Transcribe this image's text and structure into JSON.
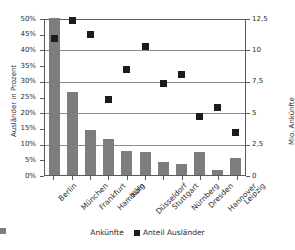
{
  "chart_data": {
    "type": "bar",
    "title": "",
    "categories": [
      "Berlin",
      "München",
      "Frankfurt",
      "Hamburg",
      "Köln",
      "Düsseldorf",
      "Stuttgart",
      "Nürnberg",
      "Dresden",
      "Hannover",
      "Leipzig"
    ],
    "series": [
      {
        "name": "Ankünfte",
        "type": "bar",
        "axis": "right",
        "unit": "Mio.",
        "values": [
          12.5,
          6.6,
          3.6,
          2.9,
          1.95,
          1.85,
          1.0,
          0.88,
          1.8,
          0.42,
          1.35
        ]
      },
      {
        "name": "Anteil Ausländer",
        "type": "scatter",
        "axis": "left",
        "unit": "%",
        "values": [
          43.8,
          49.4,
          45.1,
          24.4,
          34.0,
          41.1,
          29.3,
          32.2,
          18.8,
          21.8,
          14.0
        ]
      }
    ],
    "xlabel": "",
    "ylabel_left": "Ausländer in Prozent",
    "ylabel_right": "Mio. Ankünfte",
    "ylim_left": [
      0,
      50
    ],
    "ylim_right": [
      0,
      12.5
    ],
    "yticks_left": [
      "0%",
      "5%",
      "10%",
      "15%",
      "20%",
      "25%",
      "30%",
      "35%",
      "40%",
      "45%",
      "50%"
    ],
    "yticks_right": [
      "0",
      "2,5",
      "5",
      "7,5",
      "10",
      "12,5"
    ],
    "grid": true,
    "legend_position": "bottom",
    "legend": [
      "Ankünfte",
      "Anteil Ausländer"
    ],
    "colors": {
      "bar": "#7d7d7d",
      "marker": "#1c1c1c",
      "grid": "#8c8c8c",
      "axis": "#5a5a5a",
      "background": "#ffffff"
    }
  }
}
